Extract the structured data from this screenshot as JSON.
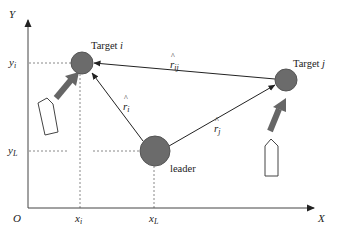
{
  "diagram": {
    "type": "formation-geometry",
    "axes": {
      "x_label": "X",
      "y_label": "Y",
      "origin_label": "O",
      "x_ticks": [
        {
          "main": "x",
          "sub": "i"
        },
        {
          "main": "x",
          "sub": "L"
        }
      ],
      "y_ticks": [
        {
          "main": "y",
          "sub": "i"
        },
        {
          "main": "y",
          "sub": "L"
        }
      ]
    },
    "nodes": {
      "target_i": {
        "label_prefix": "Target ",
        "label_var": "i"
      },
      "target_j": {
        "label_prefix": "Target ",
        "label_var": "j"
      },
      "leader": {
        "label": "leader"
      }
    },
    "vectors": {
      "r_ij": {
        "symbol": "r",
        "hat": "^",
        "sub": "ij"
      },
      "r_i": {
        "symbol": "r",
        "hat": "^",
        "sub": "i"
      },
      "r_j": {
        "symbol": "r",
        "hat": "^",
        "sub": "j"
      }
    },
    "colors": {
      "node_fill": "#6b6b6b",
      "node_stroke": "#555555",
      "heading_arrow": "#666666",
      "line": "#333333",
      "dashed_guide": "#888888",
      "boat_outline": "#444444"
    }
  }
}
